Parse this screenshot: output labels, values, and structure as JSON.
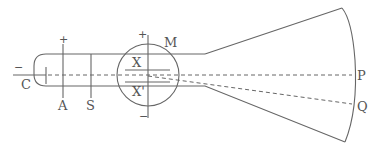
{
  "diagram": {
    "labels": {
      "cathode": "C",
      "anode": "A",
      "slit": "S",
      "magnet_region": "M",
      "plate_top": "X",
      "plate_bottom": "X'",
      "screen_point_undeflected": "P",
      "screen_point_deflected": "Q"
    },
    "signs": {
      "cathode": "−",
      "anode": "+",
      "plate_top": "+",
      "plate_bottom": "−"
    },
    "colors": {
      "line": "#666666",
      "text": "#555555",
      "background": "#ffffff"
    }
  }
}
